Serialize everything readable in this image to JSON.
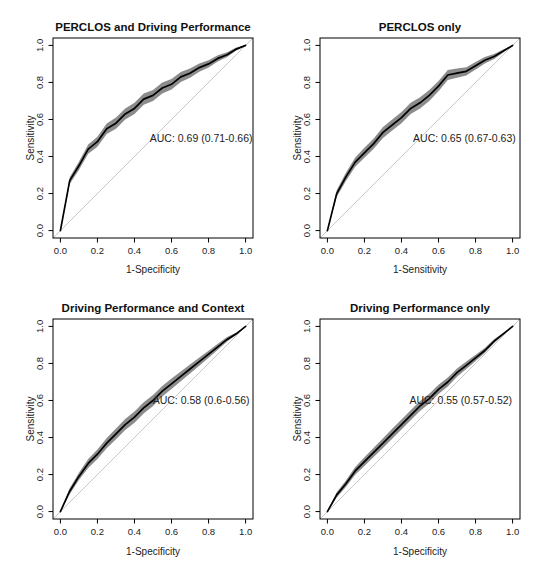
{
  "figure": {
    "background": "#ffffff",
    "colors": {
      "curve": "#000000",
      "confidence_band": "#8c8c8c",
      "diagonal": "#c9c9c9",
      "frame": "#000000",
      "text": "#222222",
      "title": "#111111"
    },
    "tick_values": [
      0,
      0.2,
      0.4,
      0.6,
      0.8,
      1
    ],
    "tick_labels": [
      "0.0",
      "0.2",
      "0.4",
      "0.6",
      "0.8",
      "1.0"
    ]
  },
  "chart_data": [
    {
      "type": "line",
      "title": "PERCLOS and Driving Performance",
      "xlabel": "1-Specificity",
      "ylabel": "Sensitivity",
      "auc_label": "AUC: 0.69 (0.71-0.66)",
      "auc": 0.69,
      "auc_ci": [
        0.71,
        0.66
      ],
      "label_pos": [
        0.76,
        0.48
      ],
      "xlim": [
        0,
        1
      ],
      "ylim": [
        0,
        1
      ],
      "x": [
        0,
        0.05,
        0.1,
        0.15,
        0.2,
        0.25,
        0.3,
        0.35,
        0.4,
        0.45,
        0.5,
        0.55,
        0.6,
        0.65,
        0.7,
        0.75,
        0.8,
        0.85,
        0.9,
        0.95,
        1
      ],
      "y": [
        0,
        0.27,
        0.35,
        0.44,
        0.48,
        0.55,
        0.58,
        0.63,
        0.66,
        0.71,
        0.73,
        0.77,
        0.79,
        0.83,
        0.85,
        0.88,
        0.9,
        0.93,
        0.95,
        0.98,
        1
      ],
      "band_halfwidth": [
        0,
        0.018,
        0.022,
        0.025,
        0.027,
        0.028,
        0.03,
        0.03,
        0.03,
        0.03,
        0.03,
        0.03,
        0.028,
        0.027,
        0.025,
        0.022,
        0.02,
        0.017,
        0.013,
        0.008,
        0
      ]
    },
    {
      "type": "line",
      "title": "PERCLOS only",
      "xlabel": "1-Sensitivity",
      "ylabel": "Sensitivity",
      "auc_label": "AUC: 0.65 (0.67-0.63)",
      "auc": 0.65,
      "auc_ci": [
        0.67,
        0.63
      ],
      "label_pos": [
        0.74,
        0.48
      ],
      "xlim": [
        0,
        1
      ],
      "ylim": [
        0,
        1
      ],
      "x": [
        0,
        0.05,
        0.1,
        0.15,
        0.2,
        0.25,
        0.3,
        0.35,
        0.4,
        0.45,
        0.5,
        0.55,
        0.6,
        0.65,
        0.7,
        0.75,
        0.8,
        0.85,
        0.9,
        0.95,
        1
      ],
      "y": [
        0,
        0.2,
        0.29,
        0.37,
        0.42,
        0.47,
        0.53,
        0.57,
        0.61,
        0.66,
        0.69,
        0.73,
        0.78,
        0.84,
        0.85,
        0.86,
        0.89,
        0.92,
        0.94,
        0.97,
        1
      ],
      "band_halfwidth": [
        0,
        0.018,
        0.022,
        0.025,
        0.027,
        0.028,
        0.03,
        0.03,
        0.03,
        0.03,
        0.03,
        0.03,
        0.028,
        0.027,
        0.025,
        0.022,
        0.02,
        0.017,
        0.013,
        0.008,
        0
      ]
    },
    {
      "type": "line",
      "title": "Driving Performance and Context",
      "xlabel": "1-Specificity",
      "ylabel": "Sensitivity",
      "auc_label": "AUC: 0.58 (0.6-0.56)",
      "auc": 0.58,
      "auc_ci": [
        0.6,
        0.56
      ],
      "label_pos": [
        0.76,
        0.58
      ],
      "xlim": [
        0,
        1
      ],
      "ylim": [
        0,
        1
      ],
      "x": [
        0,
        0.05,
        0.1,
        0.15,
        0.2,
        0.25,
        0.3,
        0.35,
        0.4,
        0.45,
        0.5,
        0.55,
        0.6,
        0.65,
        0.7,
        0.75,
        0.8,
        0.85,
        0.9,
        0.95,
        1
      ],
      "y": [
        0,
        0.11,
        0.19,
        0.26,
        0.31,
        0.37,
        0.42,
        0.47,
        0.51,
        0.56,
        0.6,
        0.65,
        0.69,
        0.73,
        0.77,
        0.81,
        0.85,
        0.89,
        0.93,
        0.96,
        1
      ],
      "band_halfwidth": [
        0,
        0.016,
        0.02,
        0.024,
        0.026,
        0.028,
        0.029,
        0.03,
        0.03,
        0.03,
        0.03,
        0.029,
        0.028,
        0.026,
        0.025,
        0.022,
        0.019,
        0.016,
        0.012,
        0.007,
        0
      ]
    },
    {
      "type": "line",
      "title": "Driving Performance only",
      "xlabel": "1-Specificity",
      "ylabel": "Sensitivity",
      "auc_label": "AUC: 0.55 (0.57-0.52)",
      "auc": 0.55,
      "auc_ci": [
        0.57,
        0.52
      ],
      "label_pos": [
        0.72,
        0.58
      ],
      "xlim": [
        0,
        1
      ],
      "ylim": [
        0,
        1
      ],
      "x": [
        0,
        0.05,
        0.1,
        0.15,
        0.2,
        0.25,
        0.3,
        0.35,
        0.4,
        0.45,
        0.5,
        0.55,
        0.6,
        0.65,
        0.7,
        0.75,
        0.8,
        0.85,
        0.9,
        0.95,
        1
      ],
      "y": [
        0,
        0.09,
        0.15,
        0.22,
        0.27,
        0.32,
        0.37,
        0.42,
        0.47,
        0.52,
        0.57,
        0.61,
        0.66,
        0.7,
        0.75,
        0.79,
        0.83,
        0.87,
        0.92,
        0.96,
        1
      ],
      "band_halfwidth": [
        0,
        0.014,
        0.018,
        0.021,
        0.023,
        0.025,
        0.026,
        0.027,
        0.027,
        0.027,
        0.027,
        0.026,
        0.025,
        0.024,
        0.022,
        0.02,
        0.017,
        0.014,
        0.011,
        0.006,
        0
      ]
    }
  ]
}
